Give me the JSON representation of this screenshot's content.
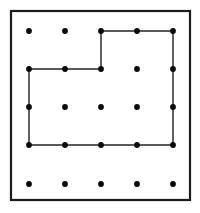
{
  "figure": {
    "background_color": "#ffffff",
    "frame": {
      "name": "outer-border",
      "x": 11,
      "y": 11,
      "width": 179,
      "height": 189,
      "stroke_color": "#1c1c1c",
      "stroke_width": 2.2
    },
    "grid": {
      "columns": 5,
      "rows": 5,
      "column_x": [
        29,
        65,
        101,
        137,
        173
      ],
      "row_y": [
        31,
        69,
        107,
        145,
        184
      ],
      "dot_radius": 2.9,
      "dot_color": "#0a0a0a"
    }
  },
  "chart_data": {
    "type": "scatter",
    "xlabel": "",
    "ylabel": "",
    "xlim": [
      0,
      4
    ],
    "ylim": [
      0,
      4
    ],
    "grid": false,
    "legend": "none",
    "points": [
      {
        "col": 0,
        "row": 0,
        "x": 29,
        "y": 31
      },
      {
        "col": 1,
        "row": 0,
        "x": 65,
        "y": 31
      },
      {
        "col": 2,
        "row": 0,
        "x": 101,
        "y": 31
      },
      {
        "col": 3,
        "row": 0,
        "x": 137,
        "y": 31
      },
      {
        "col": 4,
        "row": 0,
        "x": 173,
        "y": 31
      },
      {
        "col": 0,
        "row": 1,
        "x": 29,
        "y": 69
      },
      {
        "col": 1,
        "row": 1,
        "x": 65,
        "y": 69
      },
      {
        "col": 2,
        "row": 1,
        "x": 101,
        "y": 69
      },
      {
        "col": 3,
        "row": 1,
        "x": 137,
        "y": 69
      },
      {
        "col": 4,
        "row": 1,
        "x": 173,
        "y": 69
      },
      {
        "col": 0,
        "row": 2,
        "x": 29,
        "y": 107
      },
      {
        "col": 1,
        "row": 2,
        "x": 65,
        "y": 107
      },
      {
        "col": 2,
        "row": 2,
        "x": 101,
        "y": 107
      },
      {
        "col": 3,
        "row": 2,
        "x": 137,
        "y": 107
      },
      {
        "col": 4,
        "row": 2,
        "x": 173,
        "y": 107
      },
      {
        "col": 0,
        "row": 3,
        "x": 29,
        "y": 145
      },
      {
        "col": 1,
        "row": 3,
        "x": 65,
        "y": 145
      },
      {
        "col": 2,
        "row": 3,
        "x": 101,
        "y": 145
      },
      {
        "col": 3,
        "row": 3,
        "x": 137,
        "y": 145
      },
      {
        "col": 4,
        "row": 3,
        "x": 173,
        "y": 145
      },
      {
        "col": 0,
        "row": 4,
        "x": 29,
        "y": 184
      },
      {
        "col": 1,
        "row": 4,
        "x": 65,
        "y": 184
      },
      {
        "col": 2,
        "row": 4,
        "x": 101,
        "y": 184
      },
      {
        "col": 3,
        "row": 4,
        "x": 137,
        "y": 184
      },
      {
        "col": 4,
        "row": 4,
        "x": 173,
        "y": 184
      }
    ],
    "shapes": [
      {
        "name": "outlined-polygon",
        "kind": "polygon",
        "closed": true,
        "stroke_color": "#59595b",
        "stroke_width": 1.9,
        "fill": "none",
        "vertices_grid": [
          {
            "col": 2,
            "row": 0
          },
          {
            "col": 4,
            "row": 0
          },
          {
            "col": 4,
            "row": 3
          },
          {
            "col": 0,
            "row": 3
          },
          {
            "col": 0,
            "row": 1
          },
          {
            "col": 2,
            "row": 1
          }
        ],
        "vertices_px": [
          {
            "x": 101,
            "y": 31
          },
          {
            "x": 173,
            "y": 31
          },
          {
            "x": 173,
            "y": 145
          },
          {
            "x": 29,
            "y": 145
          },
          {
            "x": 29,
            "y": 69
          },
          {
            "x": 101,
            "y": 69
          }
        ],
        "path": "M 101 31 L 173 31 L 173 145 L 29 145 L 29 69 L 101 69 Z"
      }
    ]
  }
}
